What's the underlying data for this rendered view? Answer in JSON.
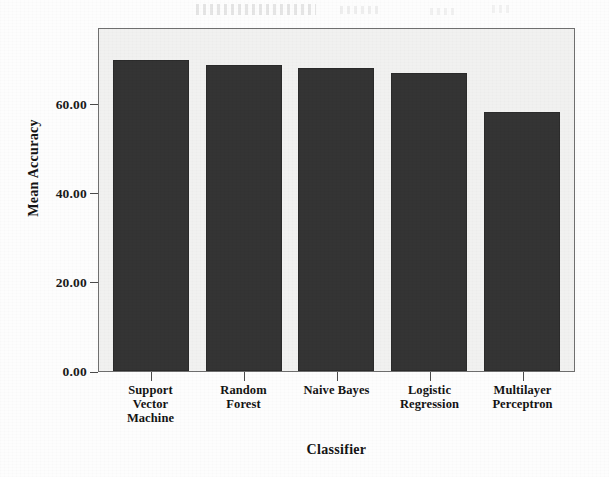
{
  "chart_data": {
    "type": "bar",
    "title": "",
    "xlabel": "Classifier",
    "ylabel": "Mean Accuracy",
    "categories": [
      "Support Vector Machine",
      "Random Forest",
      "Naive Bayes",
      "Logistic Regression",
      "Multilayer Perceptron"
    ],
    "category_lines": [
      [
        "Support",
        "Vector",
        "Machine"
      ],
      [
        "Random",
        "Forest"
      ],
      [
        "Naive Bayes"
      ],
      [
        "Logistic",
        "Regression"
      ],
      [
        "Multilayer",
        "Perceptron"
      ]
    ],
    "values": [
      69.9,
      68.8,
      68.1,
      67.0,
      58.2
    ],
    "ylim": [
      0,
      77.3
    ],
    "yticks": [
      0,
      20,
      40,
      60
    ],
    "ytick_labels": [
      "0.00",
      "20.00",
      "40.00",
      "60.00"
    ],
    "grid": false,
    "legend": null,
    "bar_color": "#343434",
    "plot_background": "#f1f1f0",
    "axis_color": "#6f6f6f"
  },
  "axes": {
    "y_title": "Mean Accuracy",
    "x_title": "Classifier"
  }
}
